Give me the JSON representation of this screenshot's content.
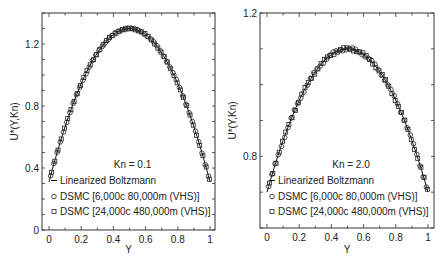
{
  "chart_data": [
    {
      "type": "line",
      "panel": "left",
      "title": "",
      "xlabel": "Y",
      "ylabel": "U*(Y,Kn)",
      "xlim": [
        -0.05,
        1.05
      ],
      "ylim": [
        0,
        1.4
      ],
      "xticks": [
        0,
        0.2,
        0.4,
        0.6,
        0.8,
        1
      ],
      "xtick_labels": [
        "0",
        "0.2",
        "0.4",
        "0.6",
        "0.8",
        "1"
      ],
      "yticks": [
        0,
        0.4,
        0.8,
        1.2
      ],
      "ytick_labels": [
        "0",
        "0.4",
        "0.8",
        "1.2"
      ],
      "grid": false,
      "annotation": "Kn = 0.1",
      "legend_position": "lower center",
      "legend": [
        {
          "marker": "line",
          "label": "Linearized Boltzmann"
        },
        {
          "marker": "circle",
          "label": "DSMC [6,000c 80,000m (VHS)]"
        },
        {
          "marker": "square",
          "label": "DSMC [24,000c 480,000m (VHS)]"
        }
      ],
      "profile": {
        "wall_value": 0.31,
        "center_value": 1.3
      },
      "series": [
        {
          "name": "Linearized Boltzmann",
          "style": "line",
          "x": [
            0,
            0.05,
            0.1,
            0.15,
            0.2,
            0.25,
            0.3,
            0.35,
            0.4,
            0.45,
            0.5,
            0.55,
            0.6,
            0.65,
            0.7,
            0.75,
            0.8,
            0.85,
            0.9,
            0.95,
            1
          ],
          "y": [
            0.31,
            0.52,
            0.7,
            0.86,
            0.99,
            1.1,
            1.18,
            1.24,
            1.28,
            1.3,
            1.3,
            1.3,
            1.28,
            1.24,
            1.18,
            1.1,
            0.99,
            0.86,
            0.7,
            0.52,
            0.31
          ]
        },
        {
          "name": "DSMC [6,000c 80,000m (VHS)]",
          "style": "circle",
          "follows_profile": true,
          "n_points": 50
        },
        {
          "name": "DSMC [24,000c 480,000m (VHS)]",
          "style": "square",
          "follows_profile": true,
          "n_points": 50
        }
      ]
    },
    {
      "type": "line",
      "panel": "right",
      "title": "",
      "xlabel": "Y",
      "ylabel": "U*(Y,Kn)",
      "xlim": [
        -0.05,
        1.05
      ],
      "ylim": [
        0.6,
        1.2
      ],
      "xticks": [
        0,
        0.2,
        0.4,
        0.6,
        0.8,
        1
      ],
      "xtick_labels": [
        "0",
        "0.2",
        "0.4",
        "0.6",
        "0.8",
        "1"
      ],
      "yticks": [
        0.8,
        1.2
      ],
      "ytick_labels": [
        "0.8",
        "1.2"
      ],
      "grid": false,
      "annotation": "Kn = 2.0",
      "legend_position": "lower center",
      "legend": [
        {
          "marker": "line",
          "label": "Linearized Boltzmann"
        },
        {
          "marker": "circle",
          "label": "DSMC [6,000c 80,000m (VHS)]"
        },
        {
          "marker": "square",
          "label": "DSMC [24,000c 480,000m (VHS)]"
        }
      ],
      "profile": {
        "wall_value": 0.7,
        "center_value": 1.1
      },
      "series": [
        {
          "name": "Linearized Boltzmann",
          "style": "line",
          "x": [
            0,
            0.05,
            0.1,
            0.15,
            0.2,
            0.25,
            0.3,
            0.35,
            0.4,
            0.45,
            0.5,
            0.55,
            0.6,
            0.65,
            0.7,
            0.75,
            0.8,
            0.85,
            0.9,
            0.95,
            1
          ],
          "y": [
            0.7,
            0.79,
            0.86,
            0.92,
            0.97,
            1.01,
            1.05,
            1.07,
            1.09,
            1.1,
            1.1,
            1.1,
            1.09,
            1.07,
            1.05,
            1.01,
            0.97,
            0.92,
            0.86,
            0.79,
            0.7
          ]
        },
        {
          "name": "DSMC [6,000c 80,000m (VHS)]",
          "style": "circle",
          "follows_profile": true,
          "n_points": 50
        },
        {
          "name": "DSMC [24,000c 480,000m (VHS)]",
          "style": "square",
          "follows_profile": true,
          "n_points": 50
        }
      ]
    }
  ],
  "layout": {
    "panels": [
      {
        "frame": [
          42,
          13,
          215,
          230
        ],
        "x0px": 49,
        "x1px": 210,
        "ymin_px": 228,
        "ymax_px": 13,
        "label_offset": 0
      },
      {
        "frame": [
          260,
          13,
          434,
          228
        ],
        "x0px": 267,
        "x1px": 428,
        "ymin_px": 226,
        "ymax_px": 13,
        "label_offset": 0
      }
    ]
  }
}
